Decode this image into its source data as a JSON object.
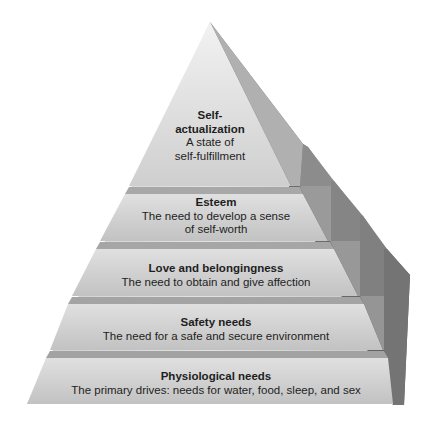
{
  "diagram": {
    "type": "pyramid",
    "colors": {
      "front_face_light": "#dcdcdc",
      "front_face_mid": "#c8c8c8",
      "band": "#a9a9a9",
      "side_dark": "#6e6e6e",
      "side_mid": "#8a8a8a",
      "text": "#1e1e1e",
      "background": "#ffffff"
    },
    "tiers": [
      {
        "title": "Self-",
        "title2": "actualization",
        "desc": "A state of",
        "desc2": "self-fulfillment"
      },
      {
        "title": "Esteem",
        "desc": "The need to develop a sense",
        "desc2": "of self-worth"
      },
      {
        "title": "Love and belongingness",
        "desc": "The need to obtain and give affection"
      },
      {
        "title": "Safety needs",
        "desc": "The need for a safe and secure environment"
      },
      {
        "title": "Physiological needs",
        "desc": "The primary drives: needs for water, food, sleep, and sex"
      }
    ]
  }
}
